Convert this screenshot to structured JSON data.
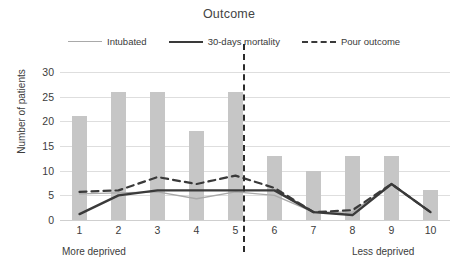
{
  "chart_data": {
    "type": "bar",
    "title": "Outcome",
    "xlabel": "",
    "ylabel": "Number of patients",
    "categories": [
      "1",
      "2",
      "3",
      "4",
      "5",
      "6",
      "7",
      "8",
      "9",
      "10"
    ],
    "ylim": [
      0,
      30
    ],
    "ytick_labels": [
      "0",
      "5",
      "10",
      "15",
      "20",
      "25",
      "30"
    ],
    "ytick_values": [
      0,
      5,
      10,
      15,
      20,
      25,
      30
    ],
    "grid": true,
    "legend_position": "top",
    "bar_series": {
      "name": "Number of patients",
      "values": [
        21,
        26,
        26,
        18,
        26,
        13,
        10,
        13,
        13,
        6
      ],
      "color": "#c6c6c6"
    },
    "series": [
      {
        "name": "Intubated",
        "type": "line",
        "values": [
          5.3,
          5.5,
          5.7,
          4.3,
          5.7,
          5.0,
          1.6,
          1.6,
          7.3,
          1.6
        ],
        "color": "#a9a9a9",
        "style": "solid-thin"
      },
      {
        "name": "30-days mortality",
        "type": "line",
        "values": [
          1.2,
          5.0,
          6.0,
          6.0,
          6.0,
          6.0,
          1.6,
          1.0,
          7.3,
          1.6
        ],
        "color": "#3a3a3a",
        "style": "solid-thick"
      },
      {
        "name": "Pour outcome",
        "type": "line",
        "values": [
          5.7,
          6.0,
          8.7,
          7.3,
          9.0,
          6.5,
          1.6,
          2.0,
          7.3,
          1.6
        ],
        "color": "#3a3a3a",
        "style": "dashed"
      }
    ],
    "annotations": {
      "left_axis_note": "More deprived",
      "right_axis_note": "Less deprived",
      "divider_after_category": "5"
    }
  },
  "legend": [
    {
      "label": "Intubated",
      "style": "thin"
    },
    {
      "label": "30-days mortality",
      "style": "thick"
    },
    {
      "label": "Pour outcome",
      "style": "dashed"
    }
  ]
}
